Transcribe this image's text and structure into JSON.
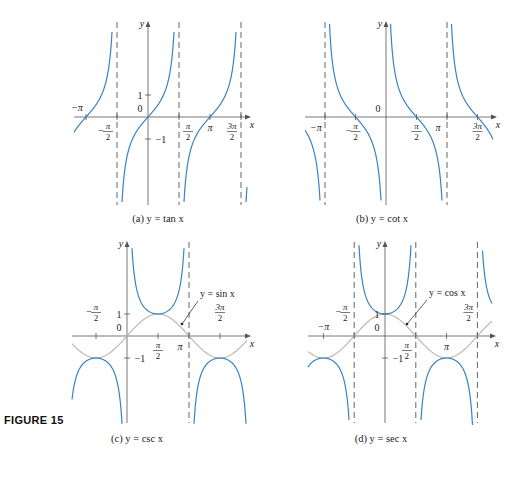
{
  "figure_label": "FIGURE 15",
  "colors": {
    "curve": "#3b82c4",
    "aux": "#b9b9b9",
    "axis": "#555555",
    "asymptote": "#555555",
    "text": "#222222"
  },
  "chart_data": [
    {
      "id": "a",
      "type": "line",
      "title": "(a) y = tan x",
      "func": "tan",
      "xlabel": "x",
      "ylabel": "y",
      "origin": [
        148,
        117
      ],
      "px_per_half_pi": 31,
      "px_per_unit": 22,
      "xrange_px": [
        74,
        247
      ],
      "yrange_px": [
        25,
        205
      ],
      "asymptotes_halfpi": [
        -1,
        1,
        3
      ],
      "xticks": [
        {
          "t": -2,
          "label": "−π",
          "pos": "above-left"
        },
        {
          "t": -1,
          "label": "−π/2",
          "pos": "below-left"
        },
        {
          "t": 1,
          "label": "π/2",
          "pos": "below-right"
        },
        {
          "t": 2,
          "label": "π",
          "pos": "below"
        },
        {
          "t": 3,
          "label": "3π/2",
          "pos": "below-left"
        }
      ],
      "yticks": [
        {
          "v": 1,
          "label": "1"
        },
        {
          "v": -1,
          "label": "−1"
        }
      ],
      "zero_label": "0",
      "caption_y": 222
    },
    {
      "id": "b",
      "type": "line",
      "title": "(b) y = cot x",
      "func": "cot",
      "xlabel": "x",
      "ylabel": "y",
      "origin": [
        386,
        117
      ],
      "px_per_half_pi": 30.5,
      "px_per_unit": 22,
      "xrange_px": [
        305,
        493
      ],
      "yrange_px": [
        25,
        205
      ],
      "asymptotes_halfpi": [
        -2,
        2
      ],
      "xticks": [
        {
          "t": -2,
          "label": "−π",
          "pos": "below-left"
        },
        {
          "t": -1,
          "label": "−π/2",
          "pos": "below"
        },
        {
          "t": 1,
          "label": "π/2",
          "pos": "below"
        },
        {
          "t": 2,
          "label": "π",
          "pos": "below-left"
        },
        {
          "t": 3,
          "label": "3π/2",
          "pos": "below"
        }
      ],
      "yticks": [],
      "zero_label": "0",
      "caption_y": 222
    },
    {
      "id": "c",
      "type": "line",
      "title": "(c) y = csc x",
      "func": "csc",
      "aux_func": "sin",
      "aux_label": "y = sin x",
      "xlabel": "x",
      "ylabel": "y",
      "origin": [
        127,
        336
      ],
      "px_per_half_pi": 31,
      "px_per_unit": 22,
      "xrange_px": [
        72,
        247
      ],
      "yrange_px": [
        245,
        423
      ],
      "asymptotes_halfpi": [
        2
      ],
      "xticks": [
        {
          "t": -1,
          "label": "−π/2",
          "pos": "above"
        },
        {
          "t": 1,
          "label": "π/2",
          "pos": "below"
        },
        {
          "t": 2,
          "label": "π",
          "pos": "below-left"
        },
        {
          "t": 3,
          "label": "3π/2",
          "pos": "above"
        }
      ],
      "yticks": [
        {
          "v": 1,
          "label": "1"
        },
        {
          "v": -1,
          "label": "−1"
        }
      ],
      "zero_label": "0",
      "caption_y": 442,
      "aux_label_pos": [
        200,
        297
      ],
      "aux_arrow": [
        [
          198,
          301
        ],
        [
          182,
          324
        ]
      ]
    },
    {
      "id": "d",
      "type": "line",
      "title": "(d) y = sec x",
      "func": "sec",
      "aux_func": "cos",
      "aux_label": "y = cos x",
      "xlabel": "x",
      "ylabel": "y",
      "origin": [
        385,
        336
      ],
      "px_per_half_pi": 30.8,
      "px_per_unit": 22,
      "xrange_px": [
        308,
        492
      ],
      "yrange_px": [
        245,
        423
      ],
      "asymptotes_halfpi": [
        -1,
        1,
        3
      ],
      "xticks": [
        {
          "t": -2,
          "label": "−π",
          "pos": "above"
        },
        {
          "t": -1,
          "label": "−π/2",
          "pos": "above-left"
        },
        {
          "t": 1,
          "label": "π/2",
          "pos": "below-left"
        },
        {
          "t": 2,
          "label": "π",
          "pos": "below"
        },
        {
          "t": 3,
          "label": "3π/2",
          "pos": "above-left"
        }
      ],
      "yticks": [
        {
          "v": 1,
          "label": "1"
        },
        {
          "v": -1,
          "label": "−1"
        }
      ],
      "zero_label": "0",
      "caption_y": 442,
      "aux_label_pos": [
        429,
        296
      ],
      "aux_arrow": [
        [
          427,
          300
        ],
        [
          407,
          324
        ]
      ]
    }
  ]
}
